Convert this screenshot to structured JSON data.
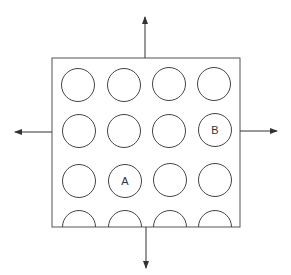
{
  "diagram": {
    "grid": {
      "rows": 4,
      "cols": 4
    },
    "labels": {
      "a": "A",
      "b": "B"
    },
    "label_positions": {
      "a": {
        "row": 3,
        "col": 2
      },
      "b": {
        "row": 2,
        "col": 4
      }
    },
    "arrows": [
      "up",
      "down",
      "left",
      "right"
    ],
    "colors": {
      "stroke": "#444444",
      "background": "#ffffff"
    }
  }
}
